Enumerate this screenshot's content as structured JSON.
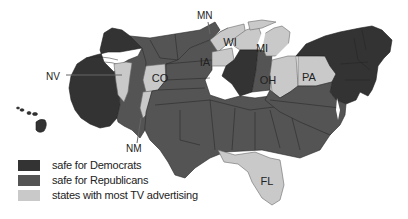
{
  "map": {
    "type": "cartogram",
    "subject": "US states by electoral status",
    "colors": {
      "safe_democrats": "#333333",
      "safe_republicans": "#545454",
      "most_tv_advertising": "#c9c9c9"
    },
    "state_labels": {
      "NV": "NV",
      "CO": "CO",
      "NM": "NM",
      "MN": "MN",
      "IA": "IA",
      "WI": "WI",
      "MI": "MI",
      "OH": "OH",
      "PA": "PA",
      "FL": "FL"
    },
    "swing_states": [
      "NV",
      "CO",
      "NM",
      "MN",
      "IA",
      "WI",
      "MI",
      "OH",
      "PA",
      "FL"
    ]
  },
  "legend": {
    "items": [
      {
        "label": "safe for Democrats",
        "color": "#333333"
      },
      {
        "label": "safe for Republicans",
        "color": "#545454"
      },
      {
        "label": "states with most TV advertising",
        "color": "#c9c9c9"
      }
    ]
  }
}
